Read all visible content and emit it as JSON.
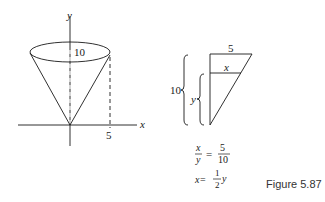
{
  "cone": {
    "axis_x_label": "x",
    "axis_y_label": "y",
    "height_label": "10",
    "radius_label": "5"
  },
  "triangle": {
    "top_label": "5",
    "inner_label": "x",
    "outer_brace_label": "10",
    "inner_brace_label": "y"
  },
  "equations": {
    "eq1_lhs_num": "x",
    "eq1_lhs_den": "y",
    "eq1_eq": "=",
    "eq1_rhs_num": "5",
    "eq1_rhs_den": "10",
    "eq2_lhs": "x",
    "eq2_eq": "=",
    "eq2_num": "1",
    "eq2_den": "2",
    "eq2_var": "y"
  },
  "caption": "Figure 5.87",
  "colors": {
    "stroke": "#1a1a1a",
    "background": "#ffffff"
  }
}
